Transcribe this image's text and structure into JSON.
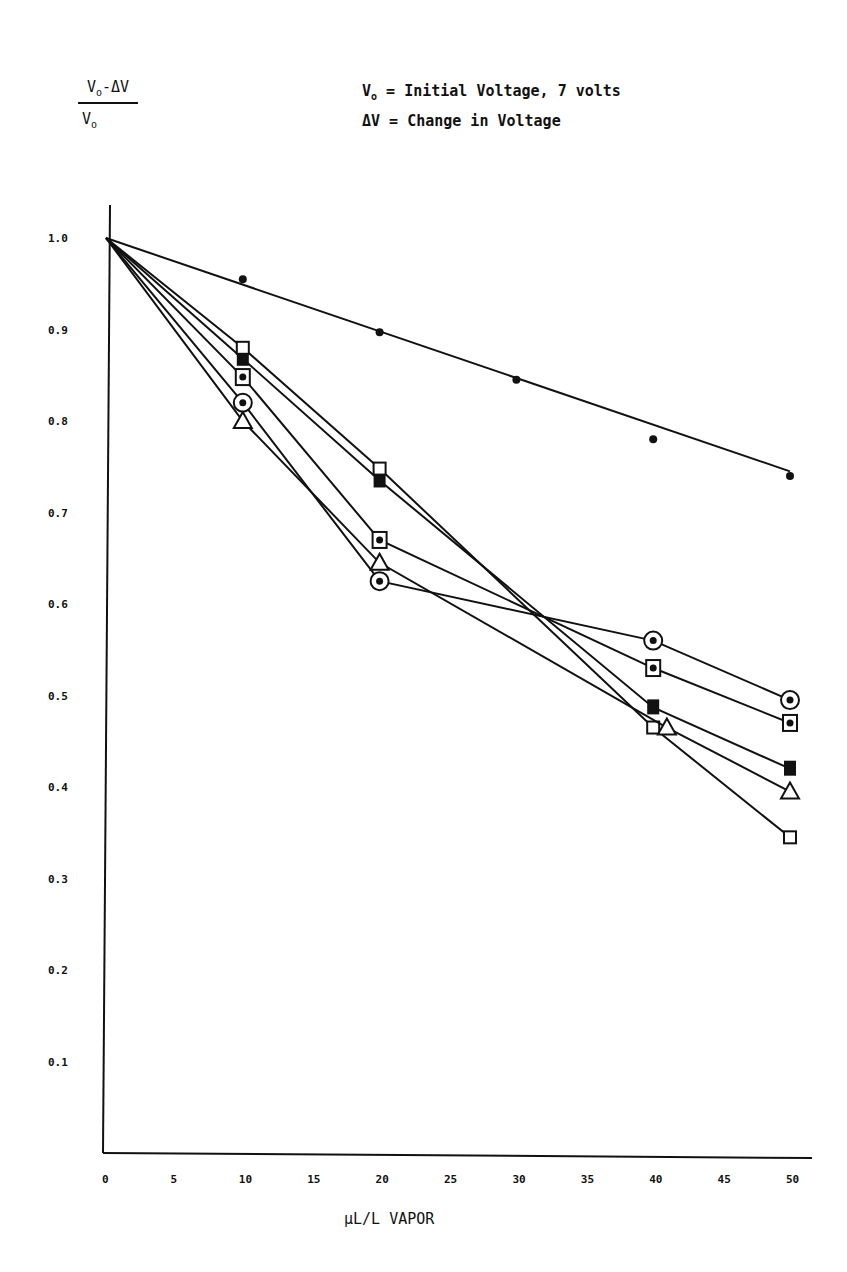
{
  "chart_data": {
    "type": "line",
    "title": "",
    "ylabel": "(Vo - ΔV) / Vo",
    "xlabel": "µL/L VAPOR",
    "legend_notes": [
      "Vo = Initial Voltage, 7 volts",
      "ΔV = Change in Voltage"
    ],
    "xlim": [
      0,
      50
    ],
    "ylim": [
      0,
      1.0
    ],
    "x_ticks": [
      "0",
      "5",
      "10",
      "15",
      "20",
      "25",
      "30",
      "35",
      "40",
      "45",
      "50"
    ],
    "y_ticks": [
      "1.0",
      "0.9",
      "0.8",
      "0.7",
      "0.6",
      "0.5",
      "0.4",
      "0.3",
      "0.2",
      "0.1"
    ],
    "grid": false,
    "series": [
      {
        "name": "filled-circle",
        "marker": "dot",
        "fit_line": [
          [
            0,
            1.0
          ],
          [
            50,
            0.745
          ]
        ],
        "points": [
          [
            10,
            0.955
          ],
          [
            20,
            0.897
          ],
          [
            30,
            0.845
          ],
          [
            40,
            0.78
          ],
          [
            50,
            0.74
          ]
        ]
      },
      {
        "name": "circled-dot",
        "marker": "circle-dot",
        "points": [
          [
            0,
            1.0
          ],
          [
            10,
            0.82
          ],
          [
            20,
            0.625
          ],
          [
            40,
            0.56
          ],
          [
            50,
            0.495
          ]
        ]
      },
      {
        "name": "boxed-dot",
        "marker": "square-dot",
        "points": [
          [
            0,
            1.0
          ],
          [
            10,
            0.848
          ],
          [
            20,
            0.67
          ],
          [
            40,
            0.53
          ],
          [
            50,
            0.47
          ]
        ]
      },
      {
        "name": "filled-square",
        "marker": "filled-square",
        "points": [
          [
            0,
            1.0
          ],
          [
            10,
            0.868
          ],
          [
            20,
            0.735
          ],
          [
            40,
            0.487
          ],
          [
            50,
            0.42
          ]
        ]
      },
      {
        "name": "open-square",
        "marker": "open-square",
        "points": [
          [
            0,
            1.0
          ],
          [
            10,
            0.88
          ],
          [
            20,
            0.748
          ],
          [
            40,
            0.465
          ],
          [
            50,
            0.345
          ]
        ]
      },
      {
        "name": "open-triangle",
        "marker": "triangle",
        "points": [
          [
            0,
            1.0
          ],
          [
            10,
            0.8
          ],
          [
            20,
            0.645
          ],
          [
            41,
            0.465
          ],
          [
            50,
            0.395
          ]
        ]
      }
    ]
  },
  "labels": {
    "y_num_main": "V",
    "y_num_sub": "o",
    "y_num_rest": "-ΔV",
    "y_den_main": "V",
    "y_den_sub": "o",
    "legend1_main": "V",
    "legend1_sub": "o",
    "legend1_rest": " = Initial Voltage, 7 volts",
    "legend2": "ΔV = Change in Voltage",
    "xlabel": "µL/L VAPOR"
  }
}
